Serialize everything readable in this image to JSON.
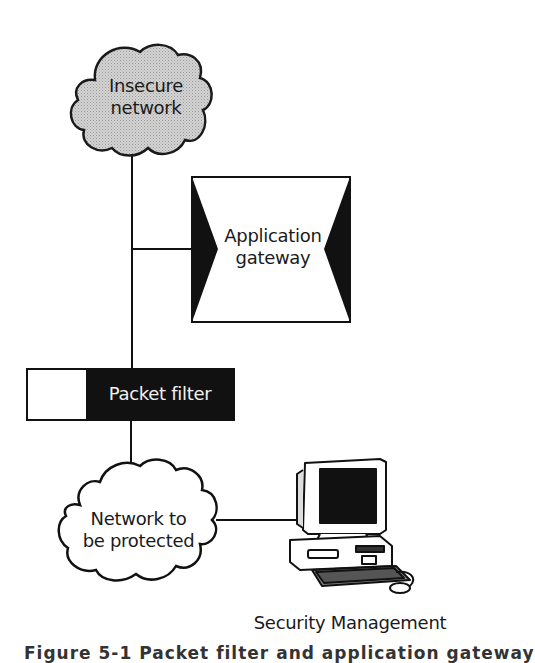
{
  "diagram": {
    "type": "network-architecture",
    "nodes": {
      "insecure_network": {
        "label_line1": "Insecure",
        "label_line2": "network",
        "shape": "cloud",
        "fill": "#c8c8c8"
      },
      "application_gateway": {
        "label_line1": "Application",
        "label_line2": "gateway",
        "shape": "box-with-inward-triangles"
      },
      "packet_filter": {
        "label": "Packet filter",
        "shape": "bar",
        "fill": "#111111"
      },
      "protected_network": {
        "label_line1": "Network to",
        "label_line2": "be protected",
        "shape": "cloud",
        "fill": "#ffffff"
      },
      "security_management": {
        "label": "Security Management",
        "shape": "computer-workstation"
      }
    },
    "edges": [
      {
        "from": "insecure_network",
        "to": "packet_filter"
      },
      {
        "from": "trunk",
        "to": "application_gateway"
      },
      {
        "from": "packet_filter",
        "to": "protected_network"
      },
      {
        "from": "protected_network",
        "to": "security_management"
      }
    ],
    "caption_partial": "Figure 5-1  Packet filter and application gateway"
  }
}
